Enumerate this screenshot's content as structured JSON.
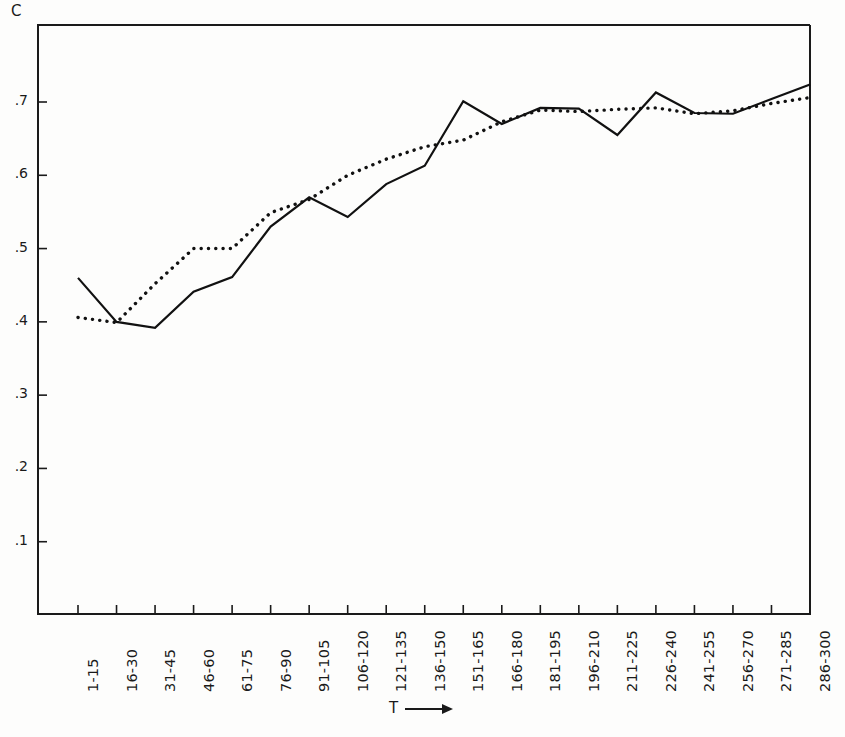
{
  "chart_data": {
    "type": "line",
    "title": "",
    "ylabel": "C",
    "xlabel": "T",
    "xlabel_arrow": "⟶",
    "grid": false,
    "legend_position": "none",
    "ylim": [
      0,
      0.78
    ],
    "ytick_values": [
      0.1,
      0.2,
      0.3,
      0.4,
      0.5,
      0.6,
      0.7
    ],
    "ytick_labels": [
      ".1",
      ".2",
      ".3",
      ".4",
      ".5",
      ".6",
      ".7"
    ],
    "categories": [
      "1-15",
      "16-30",
      "31-45",
      "46-60",
      "61-75",
      "76-90",
      "91-105",
      "106-120",
      "121-135",
      "136-150",
      "151-165",
      "166-180",
      "181-195",
      "196-210",
      "211-225",
      "226-240",
      "241-255",
      "256-270",
      "271-285",
      "286-300"
    ],
    "series": [
      {
        "name": "solid",
        "style": "solid",
        "color": "#111111",
        "values": [
          0.46,
          0.4,
          0.392,
          0.441,
          0.461,
          0.53,
          0.57,
          0.543,
          0.588,
          0.613,
          0.701,
          0.67,
          0.692,
          0.691,
          0.655,
          0.713,
          0.685,
          0.684,
          0.704,
          0.724
        ]
      },
      {
        "name": "dotted",
        "style": "dotted",
        "color": "#111111",
        "values": [
          0.406,
          0.399,
          0.452,
          0.5,
          0.5,
          0.549,
          0.567,
          0.6,
          0.622,
          0.639,
          0.648,
          0.673,
          0.689,
          0.687,
          0.69,
          0.692,
          0.684,
          0.688,
          0.698,
          0.706
        ]
      }
    ]
  }
}
